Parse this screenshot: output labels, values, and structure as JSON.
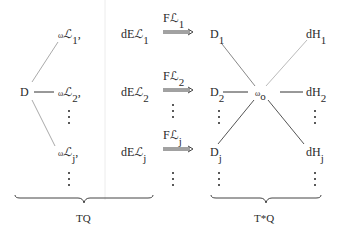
{
  "left_panel": {
    "root": "D",
    "omega_symbol": "ω",
    "script_L": "ℒ",
    "rows": [
      {
        "omega_sub": "1",
        "dE": "dE",
        "dE_sub": "1"
      },
      {
        "omega_sub": "2",
        "dE": "dE",
        "dE_sub": "2"
      },
      {
        "omega_sub": "j",
        "dE": "dE",
        "dE_sub": "j"
      }
    ],
    "comma": ",",
    "brace_label": "TQ"
  },
  "arrows": [
    {
      "label": "Fℒ",
      "sub": "1"
    },
    {
      "label": "Fℒ",
      "sub": "2"
    },
    {
      "label": "Fℒ",
      "sub": "j"
    }
  ],
  "right_panel": {
    "center": "ω",
    "center_sub": "o",
    "left_nodes": [
      {
        "label": "D",
        "sub": "1"
      },
      {
        "label": "D",
        "sub": "2"
      },
      {
        "label": "D",
        "sub": "j"
      }
    ],
    "right_nodes": [
      {
        "label": "dH",
        "sub": "1"
      },
      {
        "label": "dH",
        "sub": "2"
      },
      {
        "label": "dH",
        "sub": "j"
      }
    ],
    "brace_label": "T*Q"
  }
}
